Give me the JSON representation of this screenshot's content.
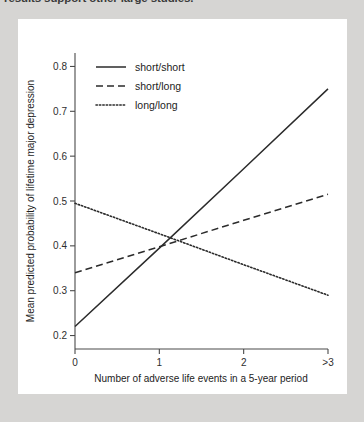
{
  "caption": {
    "cut_text": "results support other large studies."
  },
  "chart_data": {
    "type": "line",
    "title": "",
    "xlabel": "Number of adverse life events in a 5-year period",
    "ylabel": "Mean predicted probability of lifetime major depression",
    "categories": [
      "0",
      "1",
      "2",
      ">3"
    ],
    "x": [
      0,
      1,
      2,
      3
    ],
    "xlim": [
      0,
      3
    ],
    "ylim": [
      0.17,
      0.83
    ],
    "yticks": [
      0.2,
      0.3,
      0.4,
      0.5,
      0.6,
      0.7,
      0.8
    ],
    "ytick_labels": [
      "0.2",
      "0.3",
      "0.4",
      "0.5",
      "0.6",
      "0.7",
      "0.8"
    ],
    "grid": false,
    "legend_position": "top-left-inside",
    "series": [
      {
        "name": "short/short",
        "style": "solid",
        "color": "#2b2b2b",
        "values": [
          0.22,
          0.395,
          0.572,
          0.75
        ]
      },
      {
        "name": "short/long",
        "style": "dashed",
        "color": "#2b2b2b",
        "values": [
          0.34,
          0.398,
          0.457,
          0.515
        ]
      },
      {
        "name": "long/long",
        "style": "dotted",
        "color": "#2b2b2b",
        "values": [
          0.495,
          0.427,
          0.358,
          0.29
        ]
      }
    ]
  },
  "legend": {
    "items": [
      {
        "label": "short/short",
        "style": "solid"
      },
      {
        "label": "short/long",
        "style": "dashed"
      },
      {
        "label": "long/long",
        "style": "dotted"
      }
    ]
  }
}
